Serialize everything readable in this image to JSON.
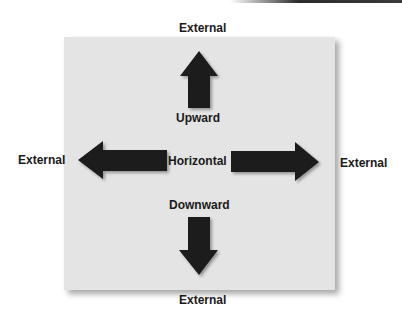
{
  "diagram": {
    "title": "",
    "colors": {
      "panel": "#e4e4e4",
      "arrow": "#1c1c1c",
      "text": "#1a1a1a"
    },
    "labels": {
      "external_top": "External",
      "external_left": "External",
      "external_right": "External",
      "external_bottom": "External",
      "upward": "Upward",
      "horizontal": "Horizontal",
      "downward": "Downward"
    },
    "arrows": [
      {
        "name": "up",
        "direction": "up"
      },
      {
        "name": "left",
        "direction": "left"
      },
      {
        "name": "right",
        "direction": "right"
      },
      {
        "name": "down",
        "direction": "down"
      }
    ]
  }
}
